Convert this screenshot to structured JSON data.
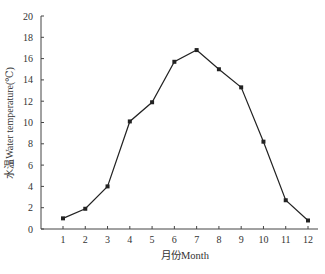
{
  "chart_data": {
    "type": "line",
    "title": "",
    "xlabel": "月份Month",
    "ylabel": "水温Water temperature(℃)",
    "categories": [
      "1",
      "2",
      "3",
      "4",
      "5",
      "6",
      "7",
      "8",
      "9",
      "10",
      "11",
      "12"
    ],
    "series": [
      {
        "name": "Water temperature",
        "values": [
          1.0,
          1.9,
          4.0,
          10.1,
          11.9,
          15.7,
          16.8,
          15.0,
          13.3,
          8.2,
          2.7,
          0.8
        ],
        "color": "#222222",
        "marker": "square"
      }
    ],
    "ylim": [
      0,
      20
    ],
    "yticks": [
      0,
      2,
      4,
      6,
      8,
      10,
      12,
      14,
      16,
      18,
      20
    ],
    "grid": false,
    "legend": null
  }
}
